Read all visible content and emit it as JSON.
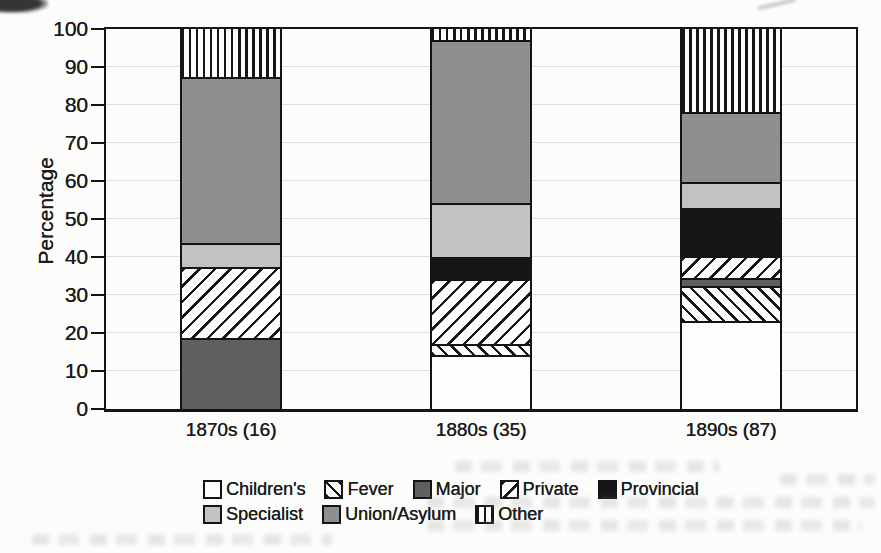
{
  "figure": {
    "background_color": "#fcfcfa",
    "ink_color": "#141414",
    "gridline_color": "#dedede"
  },
  "chart_data": {
    "type": "bar",
    "stacked": true,
    "title": "",
    "xlabel": "",
    "ylabel": "Percentage",
    "ylim": [
      0,
      100
    ],
    "yticks": [
      0,
      10,
      20,
      30,
      40,
      50,
      60,
      70,
      80,
      90,
      100
    ],
    "grid": "horizontal-faint",
    "legend_position": "bottom",
    "legend_rows": [
      5,
      3
    ],
    "categories": [
      "1870s (16)",
      "1880s (35)",
      "1890s (87)"
    ],
    "series": [
      {
        "name": "Children's",
        "pattern": "white",
        "color": "#fefefe",
        "values": [
          0.0,
          14.3,
          23.0
        ]
      },
      {
        "name": "Fever",
        "pattern": "diagonal-backslash-hatch",
        "color": "#161616",
        "values": [
          0.0,
          2.9,
          9.2
        ]
      },
      {
        "name": "Major",
        "pattern": "dark-gray",
        "color": "#606060",
        "values": [
          18.75,
          0.0,
          2.3
        ]
      },
      {
        "name": "Private",
        "pattern": "diagonal-slash-hatch",
        "color": "#161616",
        "values": [
          18.75,
          17.1,
          5.7
        ]
      },
      {
        "name": "Provincial",
        "pattern": "black",
        "color": "#161616",
        "values": [
          0.0,
          5.7,
          12.6
        ]
      },
      {
        "name": "Specialist",
        "pattern": "light-gray",
        "color": "#c2c2c2",
        "values": [
          6.25,
          14.3,
          6.9
        ]
      },
      {
        "name": "Union/Asylum",
        "pattern": "medium-gray",
        "color": "#8f8f8f",
        "values": [
          43.75,
          42.9,
          18.4
        ]
      },
      {
        "name": "Other",
        "pattern": "vertical-stripes",
        "color": "#161616",
        "values": [
          12.5,
          2.9,
          21.8
        ]
      }
    ]
  }
}
